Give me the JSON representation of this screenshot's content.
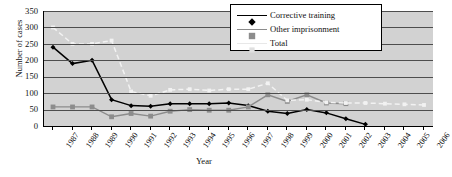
{
  "chart_data": {
    "type": "line",
    "title": "",
    "xlabel": "Year",
    "ylabel": "Number of cases",
    "ylim": [
      0,
      350
    ],
    "ytick_step": 50,
    "yticks": [
      0,
      50,
      100,
      150,
      200,
      250,
      300,
      350
    ],
    "grid": true,
    "legend_position": "top-right",
    "categories": [
      "1987",
      "1988",
      "1989",
      "1990",
      "1991",
      "1992",
      "1993",
      "1994",
      "1995",
      "1996",
      "1997",
      "1998",
      "1999",
      "2000",
      "2001",
      "2002",
      "2003",
      "2004",
      "2005",
      "2006"
    ],
    "series": [
      {
        "name": "Corrective training",
        "color": "#000000",
        "marker": "diamond",
        "values": [
          240,
          190,
          200,
          80,
          62,
          60,
          68,
          68,
          68,
          70,
          62,
          45,
          38,
          50,
          40,
          22,
          5,
          null,
          null,
          null
        ]
      },
      {
        "name": "Other imprisonment",
        "color": "#8c8c8c",
        "marker": "square",
        "values": [
          58,
          58,
          58,
          28,
          38,
          30,
          45,
          50,
          48,
          48,
          58,
          95,
          75,
          95,
          70,
          68,
          null,
          null,
          null,
          null
        ]
      },
      {
        "name": "Total",
        "color": "#f2f2f2",
        "marker": "dot",
        "values": [
          300,
          250,
          250,
          260,
          105,
          92,
          110,
          112,
          108,
          112,
          112,
          130,
          78,
          80,
          72,
          70,
          70,
          68,
          66,
          64
        ]
      }
    ]
  },
  "legend": {
    "items": [
      {
        "label": "Corrective training"
      },
      {
        "label": "Other imprisonment"
      },
      {
        "label": "Total"
      }
    ]
  }
}
